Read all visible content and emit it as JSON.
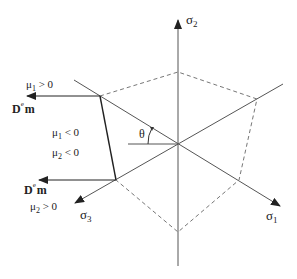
{
  "diagram": {
    "axes": {
      "sigma1": {
        "label": "σ",
        "sub": "1"
      },
      "sigma2": {
        "label": "σ",
        "sub": "2"
      },
      "sigma3": {
        "label": "σ",
        "sub": "3"
      }
    },
    "angle": {
      "label": "θ"
    },
    "vectors": {
      "top": {
        "label": "D",
        "sup": "e",
        "tail": "m"
      },
      "bottom": {
        "label": "D",
        "sup": "e",
        "tail": "m"
      }
    },
    "conditions": {
      "mu1_pos": {
        "sym": "μ",
        "sub": "1",
        "rel": " > 0"
      },
      "mu1_neg": {
        "sym": "μ",
        "sub": "1",
        "rel": " < 0"
      },
      "mu2_neg": {
        "sym": "μ",
        "sub": "2",
        "rel": " < 0"
      },
      "mu2_pos": {
        "sym": "μ",
        "sub": "2",
        "rel": " > 0"
      }
    },
    "colors": {
      "axis": "#555555",
      "dashed": "#777777",
      "edge": "#222222",
      "arrow": "#222222"
    }
  }
}
